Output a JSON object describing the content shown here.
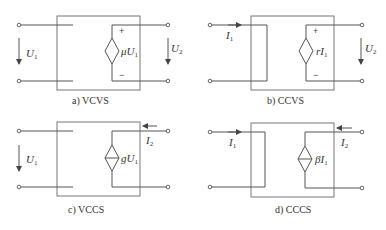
{
  "panels": [
    {
      "id": "a",
      "caption": "a) VCVS",
      "input_label": "U",
      "input_sub": "1",
      "output_label": "U",
      "output_sub": "2",
      "source_label_pre": "μU",
      "source_sub": "1",
      "plus": "+",
      "minus": "−"
    },
    {
      "id": "b",
      "caption": "b) CCVS",
      "input_label": "I",
      "input_sub": "1",
      "output_label": "U",
      "output_sub": "2",
      "source_label_pre": "rI",
      "source_sub": "1",
      "plus": "+",
      "minus": "−"
    },
    {
      "id": "c",
      "caption": "c) VCCS",
      "input_label": "U",
      "input_sub": "1",
      "output_label": "I",
      "output_sub": "2",
      "source_label_pre": "gU",
      "source_sub": "1"
    },
    {
      "id": "d",
      "caption": "d) CCCS",
      "input_label": "I",
      "input_sub": "1",
      "output_label": "I",
      "output_sub": "2",
      "source_label_pre": "βI",
      "source_sub": "1"
    }
  ]
}
